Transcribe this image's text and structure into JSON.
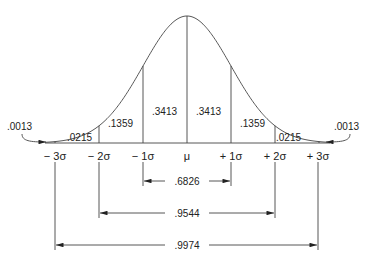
{
  "diagram": {
    "type": "normal-distribution",
    "curve": {
      "peak": [
        187,
        16
      ],
      "baseline_y": 143,
      "sigma_px": 44
    },
    "axis_labels": [
      {
        "text": "− 3σ",
        "x": 55
      },
      {
        "text": "− 2σ",
        "x": 99
      },
      {
        "text": "− 1σ",
        "x": 143
      },
      {
        "text": "μ",
        "x": 187
      },
      {
        "text": "+ 1σ",
        "x": 231
      },
      {
        "text": "+ 2σ",
        "x": 275
      },
      {
        "text": "+ 3σ",
        "x": 318
      }
    ],
    "region_areas": [
      {
        "text": ".0013",
        "x": 7,
        "y": 130,
        "note": "left tail beyond -3σ"
      },
      {
        "text": ".0215",
        "x": 67,
        "y": 141
      },
      {
        "text": ".1359",
        "x": 108,
        "y": 127
      },
      {
        "text": ".3413",
        "x": 152,
        "y": 115
      },
      {
        "text": ".3413",
        "x": 196,
        "y": 115
      },
      {
        "text": ".1359",
        "x": 240,
        "y": 127
      },
      {
        "text": ".0215",
        "x": 276,
        "y": 141
      },
      {
        "text": ".0013",
        "x": 334,
        "y": 130,
        "note": "right tail beyond +3σ"
      }
    ],
    "intervals": [
      {
        "text": ".6826",
        "range": "μ ± 1σ",
        "y": 181
      },
      {
        "text": ".9544",
        "range": "μ ± 2σ",
        "y": 213
      },
      {
        "text": ".9974",
        "range": "μ ± 3σ",
        "y": 245
      }
    ]
  }
}
